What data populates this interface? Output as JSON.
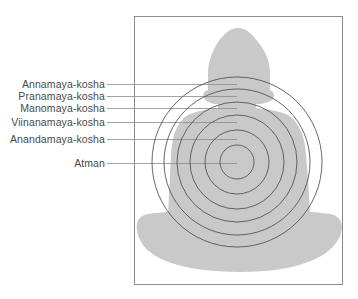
{
  "diagram": {
    "title": "",
    "center": {
      "x": 237,
      "y": 162
    },
    "colors": {
      "silhouette": "#c9c9c9",
      "circle_stroke": "#555555",
      "leader_stroke": "#8a8a8a",
      "frame_stroke": "#8c8c8c",
      "label_text": "#4a4a4a",
      "background": "#ffffff"
    },
    "layers": [
      {
        "label": "Annamaya-kosha",
        "radius": 85,
        "label_y": 84
      },
      {
        "label": "Pranamaya-kosha",
        "radius": 73,
        "label_y": 96
      },
      {
        "label": "Manomaya-kosha",
        "radius": 60,
        "label_y": 108
      },
      {
        "label": "Viinanamaya-kosha",
        "radius": 47,
        "label_y": 122
      },
      {
        "label": "Anandamaya-kosha",
        "radius": 32,
        "label_y": 139
      },
      {
        "label": "Atman",
        "radius": 17,
        "label_y": 163
      }
    ]
  }
}
